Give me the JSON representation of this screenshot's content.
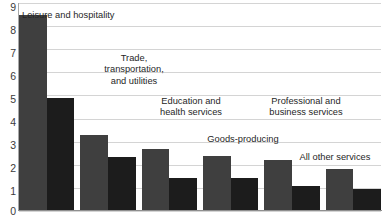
{
  "chart_data": {
    "type": "bar",
    "title": "",
    "subtitle": "",
    "xlabel": "",
    "ylabel": "",
    "ylim": [
      0,
      9
    ],
    "grid": true,
    "legend_position": "none",
    "orientation": "vertical",
    "y_ticks": [
      9,
      8,
      7,
      6,
      5,
      4,
      3,
      2,
      1,
      0
    ],
    "categories": [
      "Leisure and hospitality",
      "Trade,\ntransportation,\nand utilities",
      "Education and\nhealth services",
      "Goods-producing",
      "Professional and\nbusiness services",
      "All other services"
    ],
    "series": [
      {
        "name": "series-a",
        "color": "#3f3f3f",
        "values": [
          8.5,
          3.3,
          2.7,
          2.4,
          2.2,
          1.8
        ]
      },
      {
        "name": "series-b",
        "color": "#1c1c1c",
        "values": [
          4.9,
          2.35,
          1.45,
          1.45,
          1.1,
          0.95
        ]
      }
    ],
    "annotations": []
  },
  "axis": {
    "y_labels": [
      "9",
      "8",
      "7",
      "6",
      "5",
      "4",
      "3",
      "2",
      "1",
      "0"
    ]
  },
  "labels": {
    "cat0": "Leisure and hospitality",
    "cat1": "Trade,\ntransportation,\nand utilities",
    "cat2": "Education and\nhealth services",
    "cat3": "Goods-producing",
    "cat4": "Professional and\nbusiness services",
    "cat5": "All other services"
  },
  "colors": {
    "series_a": "#3f3f3f",
    "series_b": "#1c1c1c",
    "gridline": "#d4d4d4",
    "axis": "#8f8f8f",
    "background": "#ffffff",
    "text": "#262626"
  }
}
